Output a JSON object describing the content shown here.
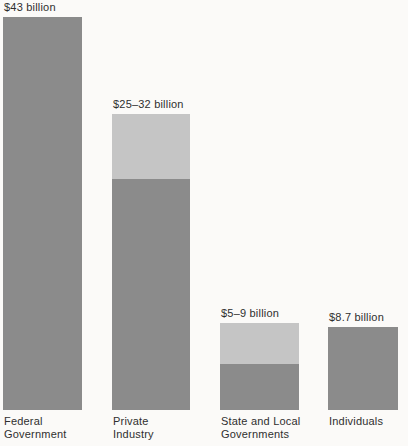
{
  "page": {
    "background": "#fbfaf8"
  },
  "chart_data": {
    "type": "bar",
    "title": "",
    "value_unit": "billion",
    "categories": [
      "Federal Government",
      "Private Industry",
      "State and Local Governments",
      "Individuals"
    ],
    "legend": "none",
    "axes_visible": false,
    "colors": {
      "solid": "#8b8b8b",
      "range": "#c5c5c5",
      "text": "#2f2f2f",
      "background": "#fbfaf8"
    },
    "layout_hints": {
      "baseline_y_px": 410,
      "value_label_gap_px": 4
    },
    "bars": [
      {
        "category": "Federal Government",
        "category_lines": [
          "Federal",
          "Government"
        ],
        "value_label": "$43 billion",
        "value_low": 43,
        "value_high": 43,
        "total_px": 393,
        "solid_px": 393
      },
      {
        "category": "Private Industry",
        "category_lines": [
          "Private",
          "Industry"
        ],
        "value_label": "$25–32 billion",
        "value_low": 25,
        "value_high": 32,
        "total_px": 296,
        "solid_px": 231
      },
      {
        "category": "State and Local Governments",
        "category_lines": [
          "State and Local",
          "Governments"
        ],
        "value_label": "$5–9 billion",
        "value_low": 5,
        "value_high": 9,
        "total_px": 87,
        "solid_px": 46
      },
      {
        "category": "Individuals",
        "category_lines": [
          "Individuals"
        ],
        "value_label": "$8.7 billion",
        "value_low": 8.7,
        "value_high": 8.7,
        "total_px": 83,
        "solid_px": 83
      }
    ]
  }
}
